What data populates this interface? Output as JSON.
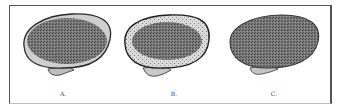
{
  "figure": {
    "panels": [
      {
        "id": "A",
        "label": "A.",
        "description": "cross-section with dense uniform stippled interior"
      },
      {
        "id": "B",
        "label": "B.",
        "description": "cross-section with lighter cortical rim and stippled interior"
      },
      {
        "id": "C",
        "label": "C.",
        "description": "cross-section with stippling extending to edge"
      }
    ]
  },
  "colors": {
    "outline": "#2a2a2a",
    "fill_dark": "#6d6d6d",
    "fill_light": "#c9c9c9",
    "frame": "#555555"
  }
}
